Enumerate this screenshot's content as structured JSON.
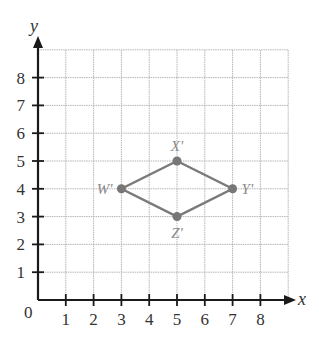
{
  "graph": {
    "x_axis_label": "x",
    "y_axis_label": "y",
    "origin_label": "0",
    "x_ticks": [
      "1",
      "2",
      "3",
      "4",
      "5",
      "6",
      "7",
      "8"
    ],
    "y_ticks": [
      "1",
      "2",
      "3",
      "4",
      "5",
      "6",
      "7",
      "8"
    ],
    "grid_max": 9,
    "colors": {
      "axis": "#1a1a1a",
      "grid": "#b5b5b5",
      "shape": "#7a7a7a",
      "point": "#777777",
      "label": "#8a8a8a"
    }
  },
  "shape": {
    "name": "rhombus W'X'Y'Z'",
    "points": [
      {
        "label": "X'",
        "x": 5,
        "y": 5
      },
      {
        "label": "Y'",
        "x": 7,
        "y": 4
      },
      {
        "label": "Z'",
        "x": 5,
        "y": 3
      },
      {
        "label": "W'",
        "x": 3,
        "y": 4
      }
    ]
  }
}
